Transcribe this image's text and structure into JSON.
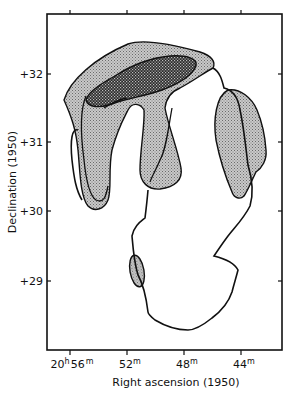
{
  "figure": {
    "xaxis": {
      "title": "Right ascension (1950)",
      "ticks": [
        {
          "main": "20",
          "unit_h": "h",
          "value": "56",
          "unit_m": "m"
        },
        {
          "value": "52",
          "unit_m": "m"
        },
        {
          "value": "48",
          "unit_m": "m"
        },
        {
          "value": "44",
          "unit_m": "m"
        }
      ]
    },
    "yaxis": {
      "title": "Declination (1950)",
      "ticks": [
        "+32",
        "+31",
        "+30",
        "+29"
      ]
    },
    "regions": [
      {
        "name": "outer-boundary",
        "fill": "none"
      },
      {
        "name": "light-shaded-region",
        "fill": "stippled-light"
      },
      {
        "name": "dark-cross-hatched-region",
        "fill": "cross-hatched-dark"
      }
    ]
  }
}
